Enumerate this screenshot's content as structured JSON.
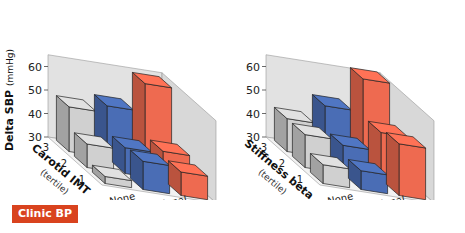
{
  "badge": {
    "label": "Clinic BP",
    "color": "#d9431e"
  },
  "colors": {
    "None": "#d0d0d0",
    "Occasional": "#4a6db5",
    "Persistent": "#ee6a50",
    "wall": "#e2e2e2",
    "floor": "#f2f2f2"
  },
  "chart_data": [
    {
      "type": "bar",
      "subtype": "3d-bar",
      "title": "",
      "ylabel": "Delta SBP (mmHg)",
      "ylabel_bold": "Delta SBP",
      "ylabel_unit": "(mmHg)",
      "xlabel": "Insomnia",
      "zlabel": "Carotid IMT",
      "zlabel_sub": "(tertile)",
      "categories": [
        "None",
        "Occasional",
        "Persistent"
      ],
      "depth_categories": [
        "1",
        "2",
        "3"
      ],
      "yticks": [
        30,
        40,
        50,
        60
      ],
      "ylim": [
        30,
        65
      ],
      "series": [
        {
          "name": "tertile 3",
          "values": [
            49,
            52,
            64
          ]
        },
        {
          "name": "tertile 2",
          "values": [
            40,
            41,
            42
          ]
        },
        {
          "name": "tertile 1",
          "values": [
            33,
            42,
            40
          ]
        }
      ]
    },
    {
      "type": "bar",
      "subtype": "3d-bar",
      "title": "",
      "ylabel": "",
      "xlabel": "Insomnia",
      "zlabel": "Stiffness beta",
      "zlabel_sub": "(tertile)",
      "categories": [
        "None",
        "Occasional",
        "Persistent"
      ],
      "depth_categories": [
        "1",
        "2",
        "3"
      ],
      "yticks": [
        30,
        40,
        50,
        60
      ],
      "ylim": [
        30,
        65
      ],
      "series": [
        {
          "name": "tertile 3",
          "values": [
            44,
            52,
            66
          ]
        },
        {
          "name": "tertile 2",
          "values": [
            44,
            42,
            50
          ]
        },
        {
          "name": "tertile 1",
          "values": [
            38,
            38,
            52
          ]
        }
      ]
    }
  ]
}
